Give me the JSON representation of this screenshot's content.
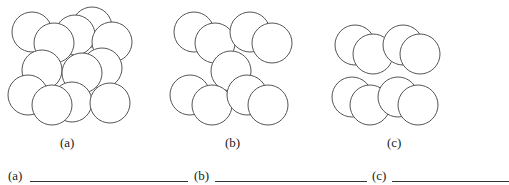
{
  "panels": [
    {
      "id": "a",
      "caption": "(a)",
      "circles": [
        [
          32,
          32
        ],
        [
          92,
          27
        ],
        [
          75,
          35
        ],
        [
          54,
          43
        ],
        [
          112,
          42
        ],
        [
          102,
          68
        ],
        [
          42,
          70
        ],
        [
          82,
          73
        ],
        [
          28,
          95
        ],
        [
          72,
          102
        ],
        [
          52,
          105
        ],
        [
          110,
          103
        ]
      ]
    },
    {
      "id": "b",
      "caption": "(b)",
      "circles": [
        [
          194,
          32
        ],
        [
          215,
          43
        ],
        [
          250,
          32
        ],
        [
          272,
          43
        ],
        [
          231,
          71
        ],
        [
          190,
          95
        ],
        [
          212,
          105
        ],
        [
          247,
          95
        ],
        [
          268,
          105
        ]
      ]
    },
    {
      "id": "c",
      "caption": "(c)",
      "circles": [
        [
          355,
          45
        ],
        [
          373,
          54
        ],
        [
          403,
          45
        ],
        [
          420,
          54
        ],
        [
          352,
          97
        ],
        [
          370,
          105
        ],
        [
          398,
          97
        ],
        [
          418,
          105
        ]
      ]
    }
  ],
  "circle_radius": 20,
  "stroke_color": "#555555",
  "answers": [
    {
      "label": "(a)",
      "value": ""
    },
    {
      "label": "(b)",
      "value": ""
    },
    {
      "label": "(c)",
      "value": ""
    }
  ]
}
